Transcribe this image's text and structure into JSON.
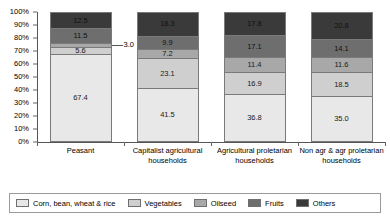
{
  "chart_data": {
    "type": "bar",
    "stacked": true,
    "stack_mode": "percent",
    "title": "",
    "xlabel": "",
    "ylabel": "",
    "ylim": [
      0,
      100
    ],
    "ytick_labels": [
      "100%",
      "90%",
      "80%",
      "70%",
      "60%",
      "50%",
      "40%",
      "30%",
      "20%",
      "10%",
      "0%"
    ],
    "ytick_values": [
      100,
      90,
      80,
      70,
      60,
      50,
      40,
      30,
      20,
      10,
      0
    ],
    "grid": false,
    "legend_position": "bottom",
    "categories": [
      "Peasant",
      "Capitalist agricultural households",
      "Agricultural proletarian households",
      "Non agr & agr proletarian households"
    ],
    "series": [
      {
        "name": "Corn, bean, wheat & rice",
        "color": "#e8e8e8",
        "values": [
          67.4,
          41.5,
          36.8,
          35.0
        ]
      },
      {
        "name": "Vegetables",
        "color": "#cfcfcf",
        "values": [
          5.6,
          23.1,
          16.9,
          18.5
        ]
      },
      {
        "name": "Oilseed",
        "color": "#a8a8a8",
        "values": [
          3.0,
          7.2,
          11.4,
          11.6
        ]
      },
      {
        "name": "Fruits",
        "color": "#6e6e6e",
        "values": [
          11.5,
          9.9,
          17.1,
          14.1
        ]
      },
      {
        "name": "Others",
        "color": "#3a3a3a",
        "values": [
          12.5,
          18.3,
          17.8,
          20.8
        ]
      }
    ],
    "callouts": [
      {
        "label": "3.0",
        "category": "Peasant",
        "series": "Oilseed"
      }
    ]
  },
  "legend": {
    "items": [
      {
        "label": "Corn, bean, wheat & rice",
        "color": "#e8e8e8"
      },
      {
        "label": "Vegetables",
        "color": "#cfcfcf"
      },
      {
        "label": "Oilseed",
        "color": "#a8a8a8"
      },
      {
        "label": "Fruits",
        "color": "#6e6e6e"
      },
      {
        "label": "Others",
        "color": "#3a3a3a"
      }
    ]
  }
}
